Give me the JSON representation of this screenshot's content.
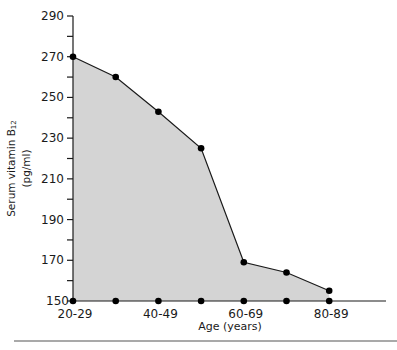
{
  "chart_data": {
    "type": "area",
    "title": "",
    "xlabel": "Age (years)",
    "ylabel": "Serum vitamin B12 (pg/ml)",
    "ylabel_main": "Serum vitamin B",
    "ylabel_sub": "12",
    "ylabel_unit": "(pg/ml)",
    "categories": [
      "20-29",
      "30-39",
      "40-49",
      "50-59",
      "60-69",
      "70-79",
      "80-89"
    ],
    "x_tick_labels": [
      "20-29",
      "40-49",
      "60-69",
      "80-89"
    ],
    "values": [
      270,
      260,
      243,
      225,
      169,
      164,
      155
    ],
    "ylim": [
      150,
      290
    ],
    "y_ticks": [
      150,
      170,
      190,
      210,
      230,
      250,
      270,
      290
    ],
    "y_minor_step": 10,
    "grid": false,
    "legend": null,
    "fill_color": "#d4d4d4",
    "line_color": "#1a1a1a",
    "marker_color": "#000000"
  }
}
